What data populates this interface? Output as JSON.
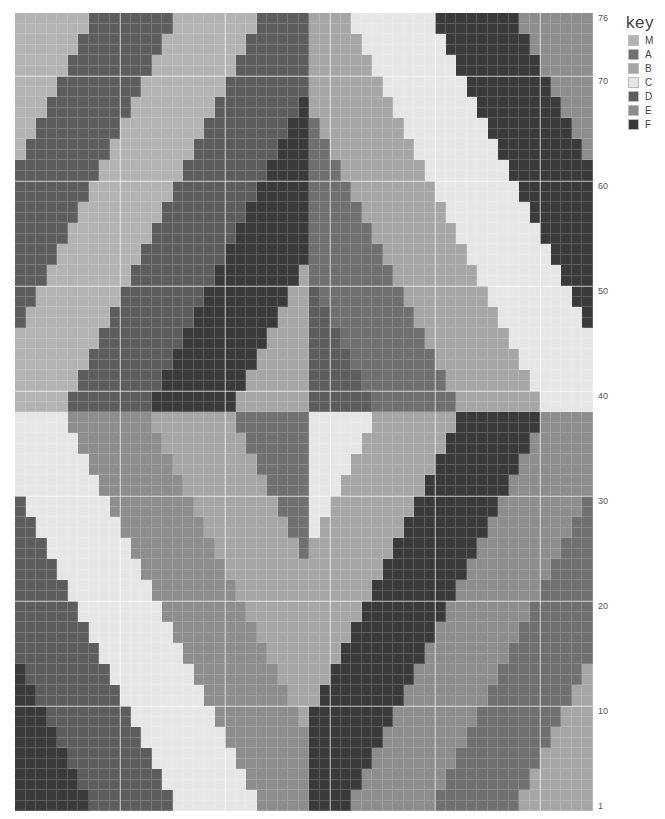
{
  "chart": {
    "columns": 55,
    "rows": 76,
    "row_labels": [
      {
        "label": "76",
        "row": 76
      },
      {
        "label": "70",
        "row": 70
      },
      {
        "label": "60",
        "row": 60
      },
      {
        "label": "50",
        "row": 50
      },
      {
        "label": "40",
        "row": 40
      },
      {
        "label": "30",
        "row": 30
      },
      {
        "label": "20",
        "row": 20
      },
      {
        "label": "10",
        "row": 10
      },
      {
        "label": "1",
        "row": 1
      }
    ],
    "center_column": 28,
    "band_width": 8,
    "rows_per_step": 2,
    "quadrants": {
      "top_left": {
        "row_range": [
          39,
          76
        ],
        "col_range": [
          0,
          27
        ],
        "origin_col": 5,
        "origin_row": 39,
        "shift": "right_going_up",
        "sequence": {
          "-4": "D",
          "-3": "M",
          "-2": "D",
          "-1": "M",
          "0": "D",
          "1": "F",
          "2": "B",
          "3": "B"
        }
      },
      "top_right": {
        "row_range": [
          39,
          76
        ],
        "col_range": [
          28,
          54
        ],
        "origin_col": 34,
        "origin_row": 39,
        "shift": "left_going_up",
        "sequence": {
          "0": "D",
          "1": "A",
          "2": "B",
          "3": "C",
          "4": "F",
          "5": "E",
          "6": "E"
        }
      },
      "bottom_left": {
        "row_range": [
          1,
          38
        ],
        "col_range": [
          0,
          27
        ],
        "origin_col": 5,
        "origin_row": 38,
        "shift": "right_going_down",
        "sequence": {
          "-4": "F",
          "-3": "F",
          "-2": "D",
          "-1": "C",
          "0": "E",
          "1": "B",
          "2": "A",
          "3": "A"
        }
      },
      "bottom_right": {
        "row_range": [
          1,
          38
        ],
        "col_range": [
          28,
          54
        ],
        "origin_col": 34,
        "origin_row": 38,
        "shift": "left_going_down",
        "sequence": {
          "0": "C",
          "1": "B",
          "2": "F",
          "3": "E",
          "4": "A",
          "5": "B",
          "6": "B"
        }
      }
    }
  },
  "key": {
    "title": "key",
    "items": [
      {
        "code": "M",
        "label": "M",
        "color": "#b3b3b3"
      },
      {
        "code": "A",
        "label": "A",
        "color": "#707070"
      },
      {
        "code": "B",
        "label": "B",
        "color": "#a6a6a6"
      },
      {
        "code": "C",
        "label": "C",
        "color": "#e6e6e6"
      },
      {
        "code": "D",
        "label": "D",
        "color": "#5d5d5d"
      },
      {
        "code": "E",
        "label": "E",
        "color": "#8d8d8d"
      },
      {
        "code": "F",
        "label": "F",
        "color": "#3a3a3a"
      }
    ]
  }
}
